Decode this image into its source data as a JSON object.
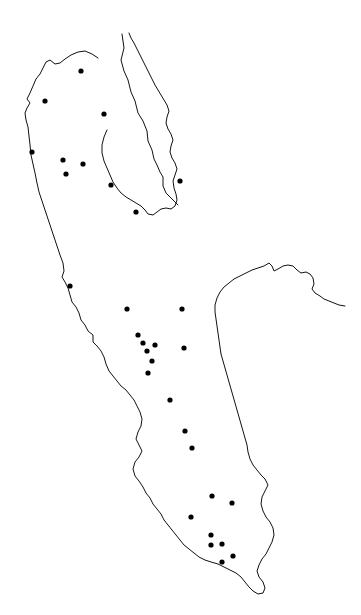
{
  "figure": {
    "kind": "point-distribution-map",
    "title": "",
    "background_color": "#ffffff",
    "width": 361,
    "height": 615
  },
  "map": {
    "outline_color": "#111111",
    "outline_width": 1,
    "point_color": "#000000",
    "point_radius": 2.6,
    "point_count": 31,
    "boundary_count": 3
  },
  "chart_data": {
    "type": "scatter",
    "title": "",
    "xlabel": "",
    "ylabel": "",
    "xlim": [
      0,
      361
    ],
    "ylim": [
      0,
      615
    ],
    "grid": false,
    "legend": null,
    "series": [
      {
        "name": "sites",
        "marker": "filled-circle",
        "color": "#000000",
        "points": [
          {
            "x": 81,
            "y": 71
          },
          {
            "x": 45,
            "y": 101
          },
          {
            "x": 104,
            "y": 114
          },
          {
            "x": 32,
            "y": 152
          },
          {
            "x": 63,
            "y": 160
          },
          {
            "x": 83,
            "y": 164
          },
          {
            "x": 66,
            "y": 174
          },
          {
            "x": 111,
            "y": 185
          },
          {
            "x": 180,
            "y": 181
          },
          {
            "x": 136,
            "y": 212
          },
          {
            "x": 70,
            "y": 286
          },
          {
            "x": 127,
            "y": 309
          },
          {
            "x": 182,
            "y": 309
          },
          {
            "x": 138,
            "y": 335
          },
          {
            "x": 143,
            "y": 343
          },
          {
            "x": 155,
            "y": 345
          },
          {
            "x": 184,
            "y": 348
          },
          {
            "x": 147,
            "y": 351
          },
          {
            "x": 152,
            "y": 361
          },
          {
            "x": 148,
            "y": 373
          },
          {
            "x": 170,
            "y": 400
          },
          {
            "x": 185,
            "y": 431
          },
          {
            "x": 192,
            "y": 448
          },
          {
            "x": 212,
            "y": 496
          },
          {
            "x": 232,
            "y": 503
          },
          {
            "x": 191,
            "y": 517
          },
          {
            "x": 211,
            "y": 535
          },
          {
            "x": 211,
            "y": 545
          },
          {
            "x": 222,
            "y": 544
          },
          {
            "x": 222,
            "y": 562
          },
          {
            "x": 233,
            "y": 556
          }
        ]
      }
    ]
  },
  "boundaries": {
    "main_outline": "M 122,34 L 124,48 L 121,60 L 124,71 L 128,80 L 131,92 L 135,101 L 138,113 L 143,121 L 147,131 L 148,141 L 152,150 L 154,159 L 157,165 L 160,172 L 163,177 L 163,186 L 166,193 L 170,197 L 174,201 L 178,205",
    "west_outline": "M 98,58 L 92,54 L 85,51 L 78,52 L 71,55 L 65,59 L 60,63 L 55,64 L 50,60 L 46,62 L 43,68 L 40,74 L 36,79 L 33,86 L 30,93 L 27,99 L 30,103 L 27,108 L 25,113 L 26,120 L 28,127 L 29,136 L 30,145 L 31,155 L 33,164 L 35,173 L 37,183 L 39,192 L 42,201 L 45,210 L 48,219 L 51,228 L 54,237 L 57,246 L 60,255 L 63,263 L 64,271 L 62,277 L 65,282 L 68,288 L 70,295 L 72,302 L 76,307 L 79,313 L 81,320 L 85,325 L 88,331 L 93,335 L 93,342 L 97,346 L 101,351 L 104,357 L 106,364 L 109,371 L 113,376 L 117,381 L 121,386 L 126,390 L 130,395 L 134,400 L 137,406 L 140,412 L 142,419 L 141,426 L 138,432 L 136,439 L 139,445 L 142,451 L 139,457 L 135,462 L 133,469 L 135,476 L 139,481 L 143,487 L 146,493 L 150,498 L 153,504 L 157,509 L 161,514 L 164,520 L 168,525 L 172,530 L 176,535 L 180,540 L 184,545 L 189,549 L 194,553 L 199,557 L 205,560 L 211,562 L 218,564 L 224,567 L 230,570 L 236,573 L 241,577 L 245,582 L 249,587 L 253,591 L 258,594 L 263,593 L 265,588 L 263,582 L 259,577 L 257,571 L 259,565 L 262,559 L 266,554 L 269,548 L 272,542 L 274,535 L 273,528 L 270,522 L 266,517 L 263,511 L 261,504 L 262,497 L 265,491 L 268,485 L 265,479 L 261,475 L 257,470 L 253,465 L 250,459 L 248,452 L 247,445 L 245,438 L 243,431 L 241,424 L 239,417 L 237,410 L 235,403 L 233,396 L 231,389 L 229,382 L 227,375 L 225,368 L 223,361 L 221,354 L 220,347 L 219,340 L 218,333 L 217,326 L 216,319 L 215,312 L 215,305 L 217,298 L 220,292 L 224,287 L 229,283 L 234,279 L 240,276 L 246,273 L 252,270 L 258,268 L 264,266 L 269,263 L 272,266 L 274,271 L 278,269 L 283,266 L 288,265 L 293,266 L 297,270 L 301,273 L 306,272 L 310,274 L 313,278 L 314,284 L 312,289 L 315,293 L 320,296 L 324,299 L 329,301 L 334,303 L 339,305 L 345,306",
    "peninsula_outline": "M 107,130 L 104,137 L 102,145 L 102,153 L 104,161 L 107,168 L 110,175 L 113,182 L 117,188 L 121,193 L 126,197 L 131,200 L 136,203 L 141,206 L 145,210 L 148,214 L 153,215 L 157,212 L 161,209 L 166,208 L 171,209 L 175,206 L 177,200 L 176,194 L 174,188 L 173,181 L 175,175 L 177,169 L 175,163 L 172,158 L 170,152 L 171,146 L 173,140 L 171,134 L 168,129 L 166,123 L 167,117 L 169,111 L 167,105 L 164,100 L 161,95 L 158,90 L 155,85 L 152,79 L 149,73 L 146,67 L 143,61 L 140,55 L 137,49 L 134,43 L 131,38 L 129,33"
  }
}
